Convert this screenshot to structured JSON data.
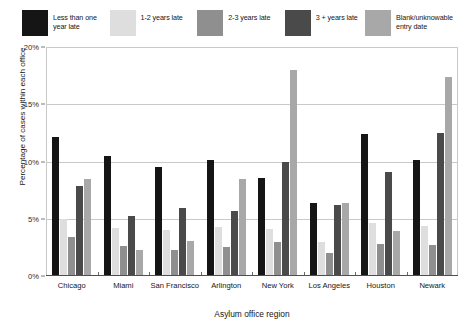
{
  "chart_data": {
    "type": "bar",
    "title": "",
    "subtitle": "",
    "xlabel": "Asylum office region",
    "ylabel": "Percentage of cases within each office",
    "ylim": [
      0,
      20
    ],
    "yticks": [
      "0%",
      "5%",
      "10%",
      "15%",
      "20%"
    ],
    "ytick_values": [
      0,
      5,
      10,
      15,
      20
    ],
    "grid": "horizontal",
    "legend_position": "top",
    "categories": [
      "Chicago",
      "Miami",
      "San Francisco",
      "Arlington",
      "New York",
      "Los Angeles",
      "Houston",
      "Newark"
    ],
    "series": [
      {
        "name": "Less than one year late",
        "color": "#151515",
        "values": [
          12.1,
          10.5,
          9.5,
          10.1,
          8.6,
          6.4,
          12.4,
          10.1
        ]
      },
      {
        "name": "1-2 years late",
        "color": "#dedede",
        "values": [
          5.0,
          4.2,
          4.0,
          4.3,
          4.1,
          3.0,
          4.6,
          4.4
        ]
      },
      {
        "name": "2-3 years late",
        "color": "#8f8f8f",
        "values": [
          3.4,
          2.6,
          2.3,
          2.5,
          3.0,
          2.0,
          2.8,
          2.7
        ]
      },
      {
        "name": "3 + years late",
        "color": "#4a4a4a",
        "values": [
          7.9,
          5.2,
          5.9,
          5.7,
          10.0,
          6.2,
          9.1,
          12.5
        ]
      },
      {
        "name": "Blank/unknowable entry date",
        "color": "#a8a8a8",
        "values": [
          8.5,
          2.3,
          3.1,
          8.5,
          18.0,
          6.4,
          3.9,
          17.4
        ]
      }
    ]
  },
  "legend": {
    "items": [
      {
        "label": "Less than one\nyear late",
        "color": "#151515"
      },
      {
        "label": "1-2 years late",
        "color": "#dedede"
      },
      {
        "label": "2-3 years late",
        "color": "#8f8f8f"
      },
      {
        "label": "3 + years late",
        "color": "#4a4a4a"
      },
      {
        "label": "Blank/unknowable\nentry date",
        "color": "#a8a8a8"
      }
    ]
  },
  "axes": {
    "x_title": "Asylum office region",
    "y_title": "Percentage of cases within each office"
  }
}
